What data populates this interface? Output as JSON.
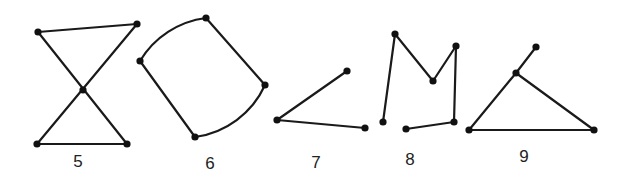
{
  "diagram": {
    "background_color": "#ffffff",
    "stroke_color": "#1a1a1a",
    "figures": [
      {
        "label": "5",
        "label_pos": [
          78,
          167
        ],
        "vertices": [
          [
            38,
            32
          ],
          [
            137,
            24
          ],
          [
            83,
            90
          ],
          [
            37,
            144
          ],
          [
            127,
            144
          ]
        ],
        "edges": [
          {
            "type": "line",
            "from": [
              38,
              32
            ],
            "to": [
              137,
              24
            ]
          },
          {
            "type": "line",
            "from": [
              137,
              24
            ],
            "to": [
              37,
              144
            ]
          },
          {
            "type": "line",
            "from": [
              37,
              144
            ],
            "to": [
              127,
              144
            ]
          },
          {
            "type": "line",
            "from": [
              127,
              144
            ],
            "to": [
              38,
              32
            ]
          }
        ]
      },
      {
        "label": "6",
        "label_pos": [
          210,
          169
        ],
        "vertices": [
          [
            140,
            61
          ],
          [
            206,
            18
          ],
          [
            265,
            85
          ],
          [
            195,
            137
          ]
        ],
        "edges": [
          {
            "type": "arc",
            "from": [
              140,
              61
            ],
            "to": [
              206,
              18
            ],
            "r": 90,
            "sweep": 1
          },
          {
            "type": "line",
            "from": [
              206,
              18
            ],
            "to": [
              265,
              85
            ]
          },
          {
            "type": "arc",
            "from": [
              265,
              85
            ],
            "to": [
              195,
              137
            ],
            "r": 90,
            "sweep": 1
          },
          {
            "type": "line",
            "from": [
              195,
              137
            ],
            "to": [
              140,
              61
            ]
          }
        ]
      },
      {
        "label": "7",
        "label_pos": [
          316,
          168
        ],
        "vertices": [
          [
            347,
            71
          ],
          [
            277,
            120
          ],
          [
            365,
            128
          ]
        ],
        "edges": [
          {
            "type": "line",
            "from": [
              347,
              71
            ],
            "to": [
              277,
              120
            ]
          },
          {
            "type": "line",
            "from": [
              277,
              120
            ],
            "to": [
              365,
              128
            ]
          }
        ]
      },
      {
        "label": "8",
        "label_pos": [
          410,
          165
        ],
        "vertices": [
          [
            383,
            122
          ],
          [
            395,
            34
          ],
          [
            433,
            81
          ],
          [
            456,
            46
          ],
          [
            454,
            122
          ],
          [
            406,
            129
          ]
        ],
        "edges": [
          {
            "type": "line",
            "from": [
              383,
              122
            ],
            "to": [
              395,
              34
            ]
          },
          {
            "type": "line",
            "from": [
              395,
              34
            ],
            "to": [
              433,
              81
            ]
          },
          {
            "type": "line",
            "from": [
              433,
              81
            ],
            "to": [
              456,
              46
            ]
          },
          {
            "type": "line",
            "from": [
              456,
              46
            ],
            "to": [
              454,
              122
            ]
          },
          {
            "type": "line",
            "from": [
              454,
              122
            ],
            "to": [
              406,
              129
            ]
          }
        ]
      },
      {
        "label": "9",
        "label_pos": [
          524,
          162
        ],
        "vertices": [
          [
            536,
            47
          ],
          [
            516,
            73
          ],
          [
            469,
            130
          ],
          [
            594,
            130
          ]
        ],
        "edges": [
          {
            "type": "line",
            "from": [
              536,
              47
            ],
            "to": [
              516,
              73
            ]
          },
          {
            "type": "line",
            "from": [
              516,
              73
            ],
            "to": [
              469,
              130
            ]
          },
          {
            "type": "line",
            "from": [
              469,
              130
            ],
            "to": [
              594,
              130
            ]
          },
          {
            "type": "line",
            "from": [
              594,
              130
            ],
            "to": [
              516,
              73
            ]
          }
        ]
      }
    ]
  }
}
